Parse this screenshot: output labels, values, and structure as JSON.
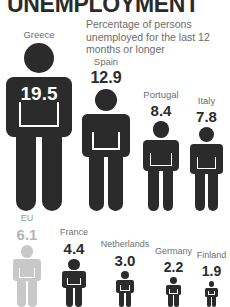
{
  "header": {
    "title": "UNEMPLOYMENT",
    "subtitle": "Percentage of persons unemployed for the last 12 months or longer"
  },
  "colors": {
    "figure_dark": "#2b2b2b",
    "figure_muted": "#c8c8c8",
    "label_gray": "#6f6f6f",
    "value_dark": "#2b2b2b",
    "value_muted": "#b4b4b4",
    "background": "#ffffff",
    "pocket_outline": "#ffffff"
  },
  "chart_data": {
    "type": "bar",
    "title": "UNEMPLOYMENT",
    "subtitle": "Percentage of persons unemployed for the last 12 months or longer",
    "xlabel": "",
    "ylabel": "Percentage of persons unemployed for 12 months or longer",
    "unit": "percent",
    "categories": [
      "Greece",
      "Spain",
      "Portugal",
      "Italy",
      "EU",
      "France",
      "Netherlands",
      "Germany",
      "Finland"
    ],
    "values": [
      19.5,
      12.9,
      8.4,
      7.8,
      6.1,
      4.4,
      3.0,
      2.2,
      1.9
    ],
    "ylim": [
      0,
      19.5
    ],
    "grid": false,
    "legend": false
  },
  "entries": [
    {
      "name": "greece",
      "label": "Greece",
      "value": "19.5",
      "value_position": "inside",
      "muted": false,
      "label_size": 9.5,
      "value_size": 19,
      "x": 6,
      "width": 66,
      "height": 168,
      "row": "top"
    },
    {
      "name": "spain",
      "label": "Spain",
      "value": "12.9",
      "value_position": "above",
      "muted": false,
      "label_size": 9.5,
      "value_size": 16,
      "x": 82,
      "width": 48,
      "height": 122,
      "row": "top"
    },
    {
      "name": "portugal",
      "label": "Portugal",
      "value": "8.4",
      "value_position": "above",
      "muted": false,
      "label_size": 9.5,
      "value_size": 15,
      "x": 143,
      "width": 36,
      "height": 90,
      "row": "top"
    },
    {
      "name": "italy",
      "label": "Italy",
      "value": "7.8",
      "value_position": "above",
      "muted": false,
      "label_size": 9.5,
      "value_size": 15,
      "x": 190,
      "width": 33,
      "height": 84,
      "row": "top"
    },
    {
      "name": "eu",
      "label": "EU",
      "value": "6.1",
      "value_position": "above",
      "muted": true,
      "label_size": 9,
      "value_size": 15,
      "x": 13,
      "width": 28,
      "height": 62,
      "row": "bottom"
    },
    {
      "name": "france",
      "label": "France",
      "value": "4.4",
      "value_position": "above",
      "muted": false,
      "label_size": 9,
      "value_size": 15,
      "x": 62,
      "width": 24,
      "height": 48,
      "row": "bottom"
    },
    {
      "name": "netherlands",
      "label": "Netherlands",
      "value": "3.0",
      "value_position": "above",
      "muted": false,
      "label_size": 9,
      "value_size": 15,
      "x": 116,
      "width": 18,
      "height": 36,
      "row": "bottom"
    },
    {
      "name": "germany",
      "label": "Germany",
      "value": "2.2",
      "value_position": "above",
      "muted": false,
      "label_size": 9,
      "value_size": 14,
      "x": 166,
      "width": 15,
      "height": 30,
      "row": "bottom"
    },
    {
      "name": "finland",
      "label": "Finland",
      "value": "1.9",
      "value_position": "above",
      "muted": false,
      "label_size": 9,
      "value_size": 14,
      "x": 205,
      "width": 13,
      "height": 26,
      "row": "bottom"
    }
  ],
  "layout": {
    "top_row_baseline": 211,
    "bottom_row_baseline": 307
  }
}
